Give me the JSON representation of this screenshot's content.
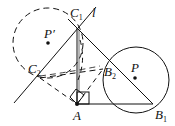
{
  "diagram": {
    "type": "geometry",
    "stroke_color": "#111111",
    "background": "#ffffff",
    "points": {
      "C1": {
        "label": "C",
        "sub": "1",
        "x": 77,
        "y": 28
      },
      "C2": {
        "label": "C",
        "sub": "2",
        "x": 40,
        "y": 78
      },
      "A": {
        "label": "A",
        "sub": "",
        "x": 77,
        "y": 104
      },
      "B1": {
        "label": "B",
        "sub": "1",
        "x": 153,
        "y": 104
      },
      "B2": {
        "label": "B",
        "sub": "2",
        "x": 103,
        "y": 69
      },
      "P": {
        "label": "P",
        "sub": "",
        "x": 135,
        "y": 78
      },
      "P_prime": {
        "label": "P′",
        "sub": "",
        "x": 48,
        "y": 43
      }
    },
    "line_label": "l",
    "circles": [
      {
        "name": "circle-P",
        "cx": 136,
        "cy": 80,
        "r": 33,
        "style": "solid"
      },
      {
        "name": "circle-P-prime",
        "cx": 48,
        "cy": 43,
        "r": 35,
        "style": "dashed"
      }
    ]
  }
}
